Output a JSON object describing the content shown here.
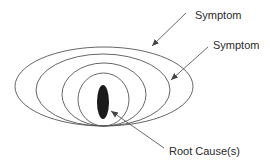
{
  "diagram": {
    "labels": {
      "symptom_outer": "Symptom",
      "symptom_inner": "Symptom",
      "root_cause": "Root Cause(s)"
    },
    "colors": {
      "stroke": "#555555",
      "core_fill": "#1a1a1a",
      "text": "#2a2a2a",
      "background": "#ffffff"
    },
    "layers": [
      {
        "name": "outer-symptom-layer",
        "left": 15,
        "right": 193,
        "top": 47,
        "bottom": 126
      },
      {
        "name": "second-symptom-layer",
        "left": 36,
        "right": 170,
        "top": 54,
        "bottom": 126
      },
      {
        "name": "third-layer",
        "left": 62,
        "right": 146,
        "top": 63,
        "bottom": 126
      },
      {
        "name": "inner-layer",
        "left": 78,
        "right": 129,
        "top": 73,
        "bottom": 126
      }
    ],
    "core": {
      "cx": 103,
      "cy": 102,
      "rx": 6,
      "ry": 17
    }
  }
}
